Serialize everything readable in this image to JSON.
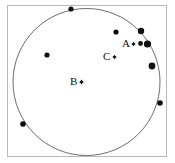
{
  "figure": {
    "type": "scatter-in-circle",
    "background_color": "#ffffff",
    "frame": {
      "stroke_color": "#b9b9b9",
      "x": 7.5,
      "y": 5.5,
      "width": 159,
      "height": 151
    },
    "circle": {
      "stroke_color": "#5b5b5b",
      "cx": 86.5,
      "cy": 82,
      "r": 73.5
    }
  },
  "labels": [
    {
      "id": "label-a",
      "text": "A",
      "x": 122,
      "y": 38
    },
    {
      "id": "label-b",
      "text": "B",
      "x": 70,
      "y": 76
    },
    {
      "id": "label-c",
      "text": "C",
      "x": 103,
      "y": 51
    }
  ],
  "labeled_markers": [
    {
      "id": "marker-a",
      "label": "A",
      "cx": 133.5,
      "cy": 44,
      "size": 2.2
    },
    {
      "id": "marker-b",
      "label": "B",
      "cx": 81.5,
      "cy": 82,
      "size": 2.4
    },
    {
      "id": "marker-c",
      "label": "C",
      "cx": 114.5,
      "cy": 57,
      "size": 2.2
    }
  ],
  "dots": [
    {
      "id": "dot-top",
      "cx": 71,
      "cy": 9,
      "r": 2.6
    },
    {
      "id": "dot-upper-right-1",
      "cx": 116,
      "cy": 32,
      "r": 2.6
    },
    {
      "id": "dot-upper-right-2",
      "cx": 141,
      "cy": 31,
      "r": 3.2
    },
    {
      "id": "dot-cluster-small",
      "cx": 140.5,
      "cy": 43.5,
      "r": 2.4
    },
    {
      "id": "dot-cluster-large",
      "cx": 147.5,
      "cy": 44,
      "r": 3.6
    },
    {
      "id": "dot-right",
      "cx": 152,
      "cy": 66,
      "r": 3.4
    },
    {
      "id": "dot-left",
      "cx": 47,
      "cy": 55,
      "r": 2.6
    },
    {
      "id": "dot-right-edge",
      "cx": 160,
      "cy": 103,
      "r": 2.8
    },
    {
      "id": "dot-lower-left",
      "cx": 23,
      "cy": 124,
      "r": 2.8
    }
  ]
}
